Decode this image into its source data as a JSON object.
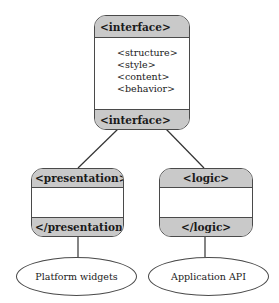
{
  "diagram": {
    "root": {
      "header": "<interface>",
      "items": [
        "<structure>",
        "<style>",
        "<content>",
        "<behavior>"
      ],
      "footer": "<interface>"
    },
    "children": [
      {
        "header": "<presentation>",
        "footer": "</presentation>",
        "target": "Platform widgets"
      },
      {
        "header": "<logic>",
        "footer": "</logic>",
        "target": "Application API"
      }
    ],
    "colors": {
      "band": "#c9c9c9",
      "stroke": "#4a4a4a"
    }
  }
}
